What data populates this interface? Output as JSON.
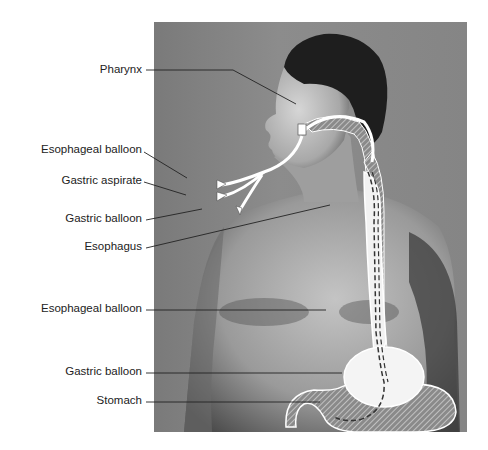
{
  "diagram": {
    "type": "anatomical-illustration",
    "labels": [
      {
        "id": "pharynx",
        "text": "Pharynx"
      },
      {
        "id": "esophageal-balloon-port",
        "text": "Esophageal balloon"
      },
      {
        "id": "gastric-aspirate-port",
        "text": "Gastric aspirate"
      },
      {
        "id": "gastric-balloon-port",
        "text": "Gastric balloon"
      },
      {
        "id": "esophagus",
        "text": "Esophagus"
      },
      {
        "id": "esophageal-balloon",
        "text": "Esophageal balloon"
      },
      {
        "id": "gastric-balloon",
        "text": "Gastric balloon"
      },
      {
        "id": "stomach",
        "text": "Stomach"
      }
    ],
    "colors": {
      "background": "#ffffff",
      "photo_mid": "#858585",
      "skin_light": "#bdbdbd",
      "skin_shadow": "#4a4a4a",
      "hair": "#1e1e1e",
      "tube": "#ffffff",
      "leader_line": "#222222"
    }
  }
}
